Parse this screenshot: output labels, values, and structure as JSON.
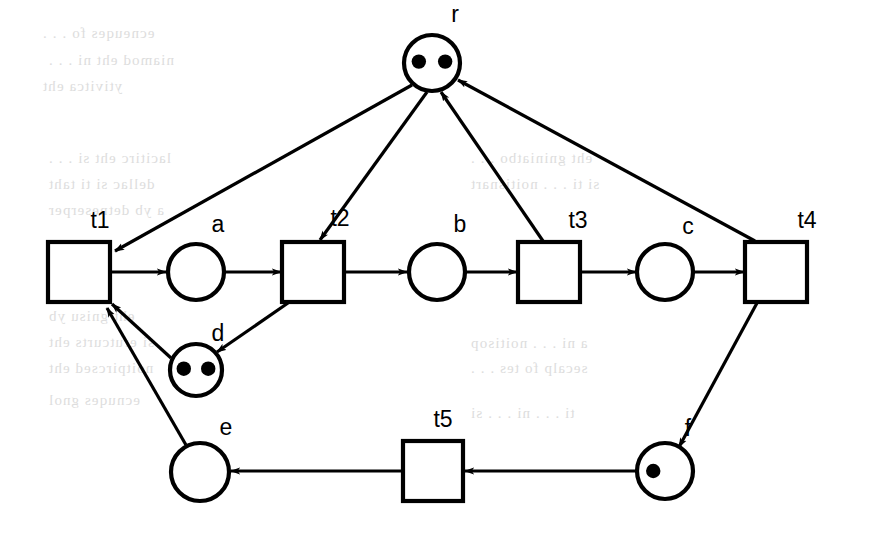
{
  "diagram": {
    "type": "petri-net",
    "stroke_color": "#000000",
    "fill_color": "#ffffff",
    "background": "#ffffff",
    "places": [
      {
        "id": "r",
        "label": "r",
        "cx": 432,
        "cy": 63,
        "r": 28,
        "tokens": 2,
        "label_x": 455,
        "label_y": 22
      },
      {
        "id": "a",
        "label": "a",
        "cx": 196,
        "cy": 272,
        "r": 28,
        "tokens": 0,
        "label_x": 218,
        "label_y": 232
      },
      {
        "id": "b",
        "label": "b",
        "cx": 437,
        "cy": 272,
        "r": 28,
        "tokens": 0,
        "label_x": 460,
        "label_y": 232
      },
      {
        "id": "c",
        "label": "c",
        "cx": 665,
        "cy": 272,
        "r": 28,
        "tokens": 0,
        "label_x": 688,
        "label_y": 234
      },
      {
        "id": "d",
        "label": "d",
        "cx": 196,
        "cy": 370,
        "r": 26,
        "tokens": 2,
        "label_x": 218,
        "label_y": 341
      },
      {
        "id": "e",
        "label": "e",
        "cx": 200,
        "cy": 472,
        "r": 29,
        "tokens": 0,
        "label_x": 226,
        "label_y": 435
      },
      {
        "id": "f",
        "label": "f",
        "cx": 665,
        "cy": 471,
        "r": 28,
        "tokens": 1,
        "label_x": 688,
        "label_y": 436
      }
    ],
    "transitions": [
      {
        "id": "t1",
        "label": "t1",
        "x": 48,
        "y": 242,
        "w": 62,
        "h": 60,
        "label_x": 100,
        "label_y": 228
      },
      {
        "id": "t2",
        "label": "t2",
        "x": 282,
        "y": 242,
        "w": 62,
        "h": 60,
        "label_x": 340,
        "label_y": 226
      },
      {
        "id": "t3",
        "label": "t3",
        "x": 518,
        "y": 242,
        "w": 62,
        "h": 60,
        "label_x": 578,
        "label_y": 228
      },
      {
        "id": "t4",
        "label": "t4",
        "x": 745,
        "y": 242,
        "w": 62,
        "h": 60,
        "label_x": 807,
        "label_y": 228
      },
      {
        "id": "t5",
        "label": "t5",
        "x": 403,
        "y": 441,
        "w": 60,
        "h": 60,
        "label_x": 443,
        "label_y": 427
      }
    ],
    "arcs": [
      {
        "from": "r",
        "to": "t1",
        "x1": 412,
        "y1": 85,
        "x2": 115,
        "y2": 251
      },
      {
        "from": "r",
        "to": "t2",
        "x1": 427,
        "y1": 92,
        "x2": 320,
        "y2": 240
      },
      {
        "from": "t1",
        "to": "a",
        "x1": 110,
        "y1": 272,
        "x2": 166,
        "y2": 272
      },
      {
        "from": "a",
        "to": "t2",
        "x1": 224,
        "y1": 272,
        "x2": 281,
        "y2": 272
      },
      {
        "from": "t2",
        "to": "b",
        "x1": 344,
        "y1": 272,
        "x2": 407,
        "y2": 272
      },
      {
        "from": "b",
        "to": "t3",
        "x1": 465,
        "y1": 272,
        "x2": 517,
        "y2": 272
      },
      {
        "from": "t3",
        "to": "c",
        "x1": 580,
        "y1": 272,
        "x2": 636,
        "y2": 272
      },
      {
        "from": "c",
        "to": "t4",
        "x1": 693,
        "y1": 272,
        "x2": 744,
        "y2": 272
      },
      {
        "from": "t3",
        "to": "r",
        "x1": 543,
        "y1": 241,
        "x2": 441,
        "y2": 92
      },
      {
        "from": "t4",
        "to": "r",
        "x1": 755,
        "y1": 241,
        "x2": 458,
        "y2": 80
      },
      {
        "from": "t2",
        "to": "d",
        "x1": 288,
        "y1": 303,
        "x2": 217,
        "y2": 352
      },
      {
        "from": "d",
        "to": "t1",
        "x1": 171,
        "y1": 358,
        "x2": 112,
        "y2": 304
      },
      {
        "from": "e",
        "to": "t1",
        "x1": 186,
        "y1": 445,
        "x2": 107,
        "y2": 308
      },
      {
        "from": "t4",
        "to": "f",
        "x1": 757,
        "y1": 303,
        "x2": 679,
        "y2": 447
      },
      {
        "from": "f",
        "to": "t5",
        "x1": 637,
        "y1": 471,
        "x2": 465,
        "y2": 471
      },
      {
        "from": "t5",
        "to": "e",
        "x1": 402,
        "y1": 471,
        "x2": 231,
        "y2": 471
      }
    ]
  },
  "ghost_text": [
    {
      "x": 42,
      "y": 25,
      "text": "ecneuqes fo . . ."
    },
    {
      "x": 48,
      "y": 52,
      "text": "niamod eht ni . . ."
    },
    {
      "x": 42,
      "y": 78,
      "text": "ytivitca eht"
    },
    {
      "x": 48,
      "y": 150,
      "text": "lacitirc eht si . . ."
    },
    {
      "x": 48,
      "y": 176,
      "text": "dellac si ti taht"
    },
    {
      "x": 48,
      "y": 202,
      "text": "a yb detneserper"
    },
    {
      "x": 48,
      "y": 308,
      "text": "eht gnisu yb"
    },
    {
      "x": 48,
      "y": 334,
      "text": "si erutcurts eht"
    },
    {
      "x": 48,
      "y": 360,
      "text": "noitpircsed eht"
    },
    {
      "x": 48,
      "y": 392,
      "text": "ecnuqes gnol"
    },
    {
      "x": 470,
      "y": 150,
      "text": "eht gniniatbo . . ."
    },
    {
      "x": 470,
      "y": 176,
      "text": "si ti . . . noitisnart"
    },
    {
      "x": 470,
      "y": 335,
      "text": "a ni . . . noitisop"
    },
    {
      "x": 470,
      "y": 360,
      "text": "secalp fo tes . . ."
    },
    {
      "x": 470,
      "y": 405,
      "text": "ti . . . ni . . . si"
    }
  ]
}
